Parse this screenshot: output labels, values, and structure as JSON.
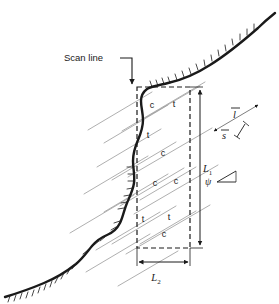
{
  "figure": {
    "type": "scanline-discontinuity-survey-diagram",
    "caption_label": "Scan line",
    "background_color": "#ffffff",
    "ink_color": "#1a1a1a",
    "trace_color": "#8a8a8a",
    "slope": {
      "name": "rock-slope-profile",
      "hatch_side": "downslope",
      "description_label": ""
    },
    "sample_window": {
      "name": "sampling-window",
      "style": "dashed-rectangle",
      "height_label": "L",
      "height_subscript": "1",
      "width_label": "L",
      "width_subscript": "2"
    },
    "trace_labels": [
      {
        "text": "c",
        "x": 152,
        "y": 108
      },
      {
        "text": "t",
        "x": 174,
        "y": 107
      },
      {
        "text": "t",
        "x": 148,
        "y": 138
      },
      {
        "text": "c",
        "x": 163,
        "y": 156
      },
      {
        "text": "c",
        "x": 155,
        "y": 186
      },
      {
        "text": "c",
        "x": 176,
        "y": 184
      },
      {
        "text": "t",
        "x": 143,
        "y": 222
      },
      {
        "text": "t",
        "x": 169,
        "y": 220
      },
      {
        "text": "c",
        "x": 164,
        "y": 237
      }
    ],
    "annotations": {
      "trace_length_symbol": "l",
      "trace_length_bar": true,
      "spacing_symbol": "s",
      "spacing_bar": true,
      "dip_angle_symbol": "ψ"
    },
    "legend_note": ""
  }
}
